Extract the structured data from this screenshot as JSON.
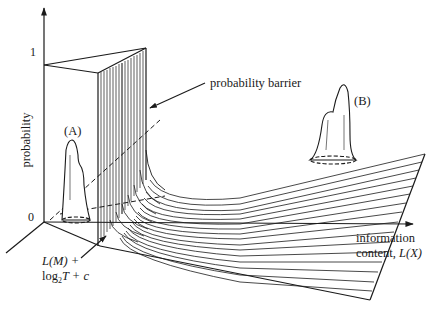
{
  "figure": {
    "y_axis": {
      "label": "probability",
      "ticks": [
        {
          "label": "1",
          "value": 1
        },
        {
          "label": "0",
          "value": 0
        }
      ]
    },
    "x_axis": {
      "label_line1": "information",
      "label_line2_text": "content, ",
      "label_line2_math": "L(X)"
    },
    "annotations": {
      "barrier": "probability barrier",
      "peak_a": "(A)",
      "peak_b": "(B)",
      "threshold_line1": "L(M) +",
      "threshold_line2_pre": "log",
      "threshold_line2_sub": "2",
      "threshold_line2_post": "T + c"
    }
  }
}
